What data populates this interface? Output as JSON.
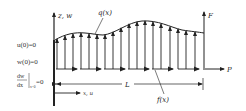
{
  "diagram": {
    "type": "cantilever-beam-loading",
    "colors": {
      "line": "#222222",
      "background": "#ffffff"
    },
    "labels": {
      "axis_vertical": "z, w",
      "distributed_load": "q(x)",
      "end_force": "F",
      "axial_force": "P",
      "length": "L",
      "axis_horizontal": "x, u",
      "axial_distributed_load": "f(x)"
    },
    "boundary_conditions": [
      {
        "lhs": "u(0)",
        "rhs": "=0"
      },
      {
        "lhs": "w(0)",
        "rhs": "=0"
      },
      {
        "numerator": "dw",
        "denominator": "dx",
        "eval": "x=0",
        "rhs": "=0"
      }
    ]
  }
}
